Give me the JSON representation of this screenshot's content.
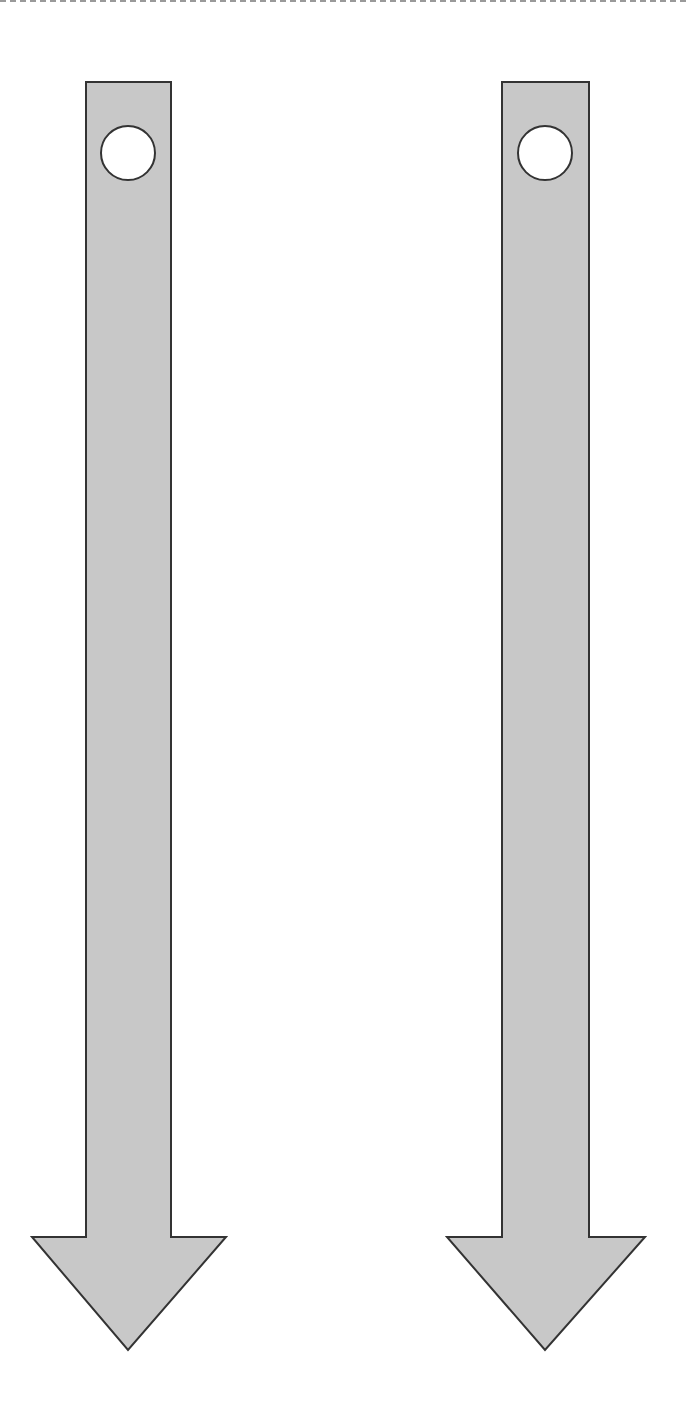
{
  "diagram": {
    "type": "downward-arrows",
    "background_color": "#ffffff",
    "top_border": {
      "style": "dashed",
      "color": "#9a9a9a"
    },
    "arrow_style": {
      "fill": "#c8c8c8",
      "stroke": "#333333",
      "stroke_width": 2,
      "marker_fill": "#ffffff",
      "marker_stroke": "#333333"
    },
    "arrows": [
      {
        "id": "left-arrow",
        "direction": "down",
        "shaft": {
          "x1": 86,
          "x2": 171,
          "top": 82,
          "bottom": 1237
        },
        "head": {
          "left": 32,
          "right": 226,
          "base_y": 1237,
          "tip_x": 128,
          "tip_y": 1350
        },
        "marker": {
          "shape": "circle",
          "cx": 128,
          "cy": 153,
          "r": 27
        }
      },
      {
        "id": "right-arrow",
        "direction": "down",
        "shaft": {
          "x1": 502,
          "x2": 589,
          "top": 82,
          "bottom": 1237
        },
        "head": {
          "left": 447,
          "right": 645,
          "base_y": 1237,
          "tip_x": 545,
          "tip_y": 1350
        },
        "marker": {
          "shape": "circle",
          "cx": 545,
          "cy": 153,
          "r": 27
        }
      }
    ]
  }
}
